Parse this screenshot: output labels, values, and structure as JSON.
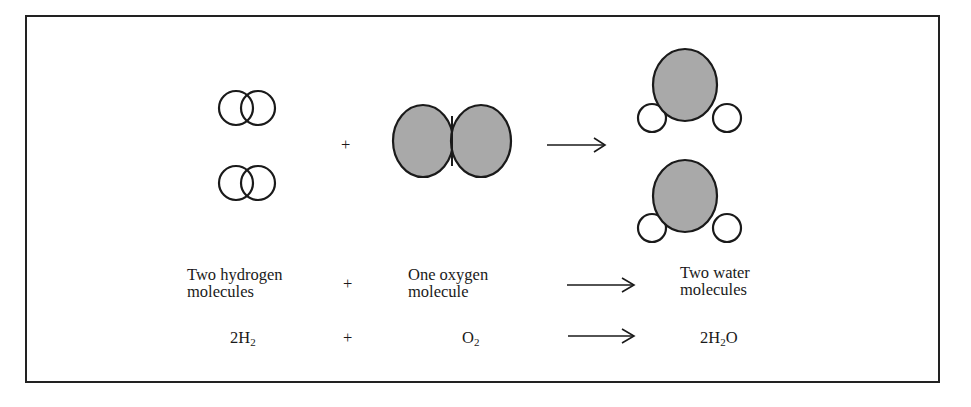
{
  "diagram": {
    "reactants": [
      {
        "label_line1": "Two hydrogen",
        "label_line2": "molecules",
        "formula_coef": "2",
        "formula_el": "H",
        "formula_sub": "2"
      },
      {
        "label_line1": "One oxygen",
        "label_line2": "molecule",
        "formula_coef": "",
        "formula_el": "O",
        "formula_sub": "2"
      }
    ],
    "products": [
      {
        "label_line1": "Two water",
        "label_line2": "molecules",
        "formula_coef": "2",
        "formula_el": "H",
        "formula_sub": "2",
        "formula_tail": "O"
      }
    ],
    "operators": {
      "plus": "+",
      "arrow": "→"
    },
    "colors": {
      "oxygen_fill": "#a9a9a9",
      "hydrogen_fill": "#ffffff",
      "stroke": "#1a1a1a",
      "frame": "#222222"
    }
  }
}
